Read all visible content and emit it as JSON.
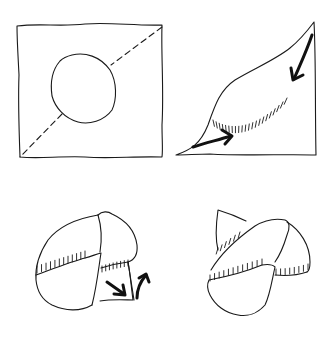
{
  "figure": {
    "type": "folding-instruction-diagram",
    "steps": [
      {
        "step": 1,
        "description": "square sheet with circle drawn in center and dashed diagonal fold line"
      },
      {
        "step": 2,
        "description": "sheet folded into triangle, arrows indicate bringing corners inward, crease hatching along curve"
      },
      {
        "step": 3,
        "description": "pouch shape formed, flap tucked with arrows showing tuck-in and lift"
      },
      {
        "step": 4,
        "description": "finished folded pouch"
      }
    ],
    "line_color": "#1a1a1a",
    "background_color": "#ffffff"
  }
}
